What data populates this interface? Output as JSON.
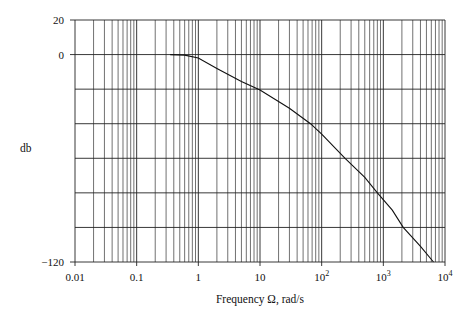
{
  "chart_data": {
    "type": "line",
    "title": "",
    "xlabel": "Frequency Ω, rad/s",
    "ylabel": "db",
    "xscale": "log",
    "xlim": [
      0.01,
      10000
    ],
    "ylim": [
      -120,
      20
    ],
    "grid": true,
    "legend": "none",
    "x_ticks": [
      {
        "value": 0.01,
        "label": "0.01",
        "exp": ""
      },
      {
        "value": 0.1,
        "label": "0.1",
        "exp": ""
      },
      {
        "value": 1,
        "label": "1",
        "exp": ""
      },
      {
        "value": 10,
        "label": "10",
        "exp": ""
      },
      {
        "value": 100,
        "label": "10",
        "exp": "2"
      },
      {
        "value": 1000,
        "label": "10",
        "exp": "3"
      },
      {
        "value": 10000,
        "label": "10",
        "exp": "4"
      }
    ],
    "y_ticks": [
      {
        "value": 20,
        "label": "20"
      },
      {
        "value": 0,
        "label": "0"
      },
      {
        "value": -120,
        "label": "−120"
      }
    ],
    "y_gridlines": [
      20,
      0,
      -20,
      -40,
      -60,
      -80,
      -100,
      -120
    ],
    "series": [
      {
        "name": "magnitude response",
        "x": [
          0.35,
          0.6,
          1,
          2,
          5,
          10,
          30,
          66,
          100,
          240,
          500,
          800,
          1400,
          2100,
          4000,
          6500
        ],
        "y": [
          0,
          -0.3,
          -2,
          -8,
          -15.5,
          -20.5,
          -31,
          -40,
          -46,
          -60,
          -71,
          -80,
          -90,
          -100,
          -111,
          -120
        ]
      }
    ]
  }
}
